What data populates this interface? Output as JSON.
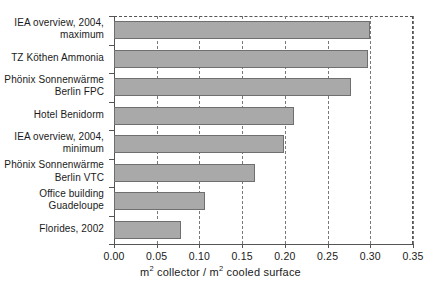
{
  "chart_data": {
    "type": "bar",
    "orientation": "horizontal",
    "title": "",
    "xlabel": "m² collector / m² cooled surface",
    "ylabel": "",
    "xlim": [
      0.0,
      0.35
    ],
    "xticks": [
      "0.00",
      "0.05",
      "0.10",
      "0.15",
      "0.20",
      "0.25",
      "0.30",
      "0.35"
    ],
    "xtick_values": [
      0.0,
      0.05,
      0.1,
      0.15,
      0.2,
      0.25,
      0.3,
      0.35
    ],
    "grid": "vertical dashed gridlines at each x tick",
    "legend": "none",
    "bar_color": "#a9a9a9",
    "bar_edge_color": "#6f6f6f",
    "categories": [
      "IEA overview, 2004, maximum",
      "TZ Köthen Ammonia",
      "Phönix Sonnenwärme Berlin FPC",
      "Hotel Benidorm",
      "IEA overview, 2004, minimum",
      "Phönix Sonnenwärme Berlin VTC",
      "Office building Guadeloupe",
      "Florides, 2002"
    ],
    "values": [
      0.3,
      0.297,
      0.277,
      0.211,
      0.199,
      0.165,
      0.107,
      0.078
    ]
  },
  "axis_title": {
    "part1": "m",
    "sup1": "2",
    "part2": " collector / m",
    "sup2": "2",
    "part3": " cooled surface"
  },
  "category_labels": [
    {
      "line1": "IEA overview, 2004,",
      "line2": "maximum"
    },
    {
      "line1": "TZ Köthen Ammonia",
      "line2": ""
    },
    {
      "line1": "Phönix Sonnenwärme",
      "line2": "Berlin FPC"
    },
    {
      "line1": "Hotel Benidorm",
      "line2": ""
    },
    {
      "line1": "IEA overview, 2004,",
      "line2": "minimum"
    },
    {
      "line1": "Phönix Sonnenwärme",
      "line2": "Berlin VTC"
    },
    {
      "line1": "Office building",
      "line2": "Guadeloupe"
    },
    {
      "line1": "Florides, 2002",
      "line2": ""
    }
  ]
}
